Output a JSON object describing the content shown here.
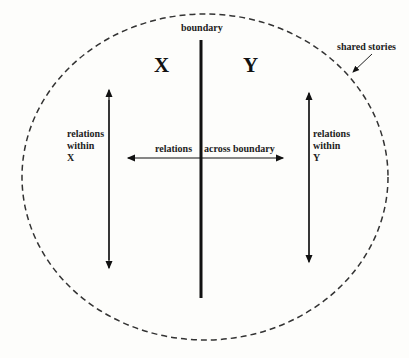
{
  "diagram": {
    "labels": {
      "boundary": "boundary",
      "x_big": "X",
      "y_big": "Y",
      "shared_stories": "shared stories",
      "relations_within_x": [
        "relations",
        "within",
        "X"
      ],
      "relations_within_y": [
        "relations",
        "within",
        "Y"
      ],
      "relations_left": "relations",
      "across_boundary": "across boundary"
    },
    "colors": {
      "line": "#111111",
      "dash": "#333333",
      "background": "#fdfdfb"
    }
  }
}
